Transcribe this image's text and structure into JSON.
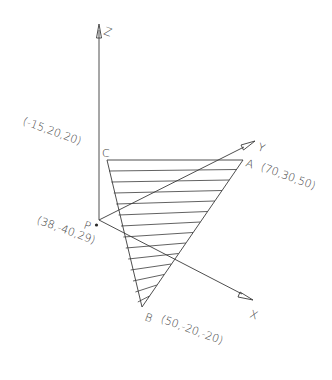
{
  "diagram": {
    "axes": {
      "x": {
        "label": "X"
      },
      "y": {
        "label": "Y"
      },
      "z": {
        "label": "Z"
      }
    },
    "points": {
      "A": {
        "name": "A",
        "coords": "(70,30,50)"
      },
      "B": {
        "name": "B",
        "coords": "(50,-20,-20)"
      },
      "C": {
        "name": "C",
        "coords": "(-15,20,20)"
      },
      "P": {
        "name": "P",
        "coords": "(38,-40,29)"
      }
    },
    "plane": {
      "vertices": [
        "A",
        "B",
        "C"
      ],
      "fill": "hatched"
    },
    "colors": {
      "line": "#3a3a3a",
      "background": "#ffffff"
    }
  }
}
